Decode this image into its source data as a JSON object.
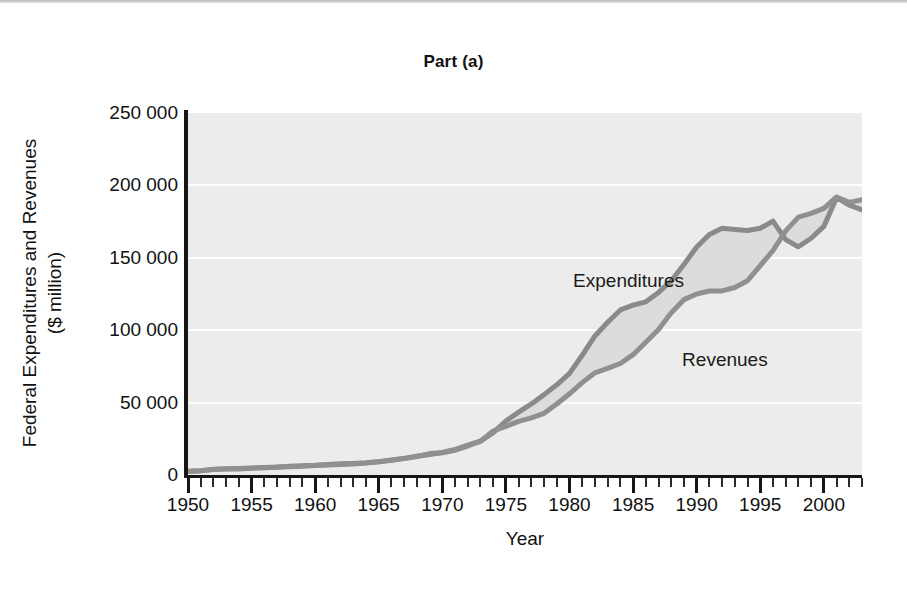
{
  "figure": {
    "title": "Part (a)",
    "background_color": "#ffffff",
    "plot_background_color": "#ececec",
    "axis_color": "#161616",
    "gridline_color": "#fdfdfd"
  },
  "axes": {
    "x_title": "Year",
    "y_title_line1": "Federal Expenditures and Revenues",
    "y_title_line2": "($ million)",
    "y_ticks": [
      "0",
      "50 000",
      "100 000",
      "150 000",
      "200 000",
      "250 000"
    ],
    "x_ticks": [
      "1950",
      "1955",
      "1960",
      "1965",
      "1970",
      "1975",
      "1980",
      "1985",
      "1990",
      "1995",
      "2000"
    ]
  },
  "annotations": {
    "expenditures_label": "Expenditures",
    "revenues_label": "Revenues"
  },
  "chart_data": {
    "type": "area",
    "title": "Part (a)",
    "subtitle": "",
    "xlabel": "Year",
    "ylabel": "Federal Expenditures and Revenues ($ million)",
    "xlim": [
      1950,
      2003
    ],
    "ylim": [
      0,
      250000
    ],
    "grid": true,
    "grid_axis": "y",
    "legend_position": "in-plot-annotation",
    "y_tick_values": [
      0,
      50000,
      100000,
      150000,
      200000,
      250000
    ],
    "x_tick_values": [
      1950,
      1955,
      1960,
      1965,
      1970,
      1975,
      1980,
      1985,
      1990,
      1995,
      2000
    ],
    "x_minor_tick_interval": 1,
    "x": [
      1950,
      1951,
      1952,
      1953,
      1954,
      1955,
      1956,
      1957,
      1958,
      1959,
      1960,
      1961,
      1962,
      1963,
      1964,
      1965,
      1966,
      1967,
      1968,
      1969,
      1970,
      1971,
      1972,
      1973,
      1974,
      1975,
      1976,
      1977,
      1978,
      1979,
      1980,
      1981,
      1982,
      1983,
      1984,
      1985,
      1986,
      1987,
      1988,
      1989,
      1990,
      1991,
      1992,
      1993,
      1994,
      1995,
      1996,
      1997,
      1998,
      1999,
      2000,
      2001,
      2002,
      2003
    ],
    "series": [
      {
        "name": "Expenditures",
        "color": "#8a8a8a",
        "values": [
          2600,
          3000,
          3900,
          4300,
          4500,
          4800,
          5100,
          5500,
          6100,
          6400,
          6700,
          7300,
          7700,
          8000,
          8400,
          9200,
          10300,
          11500,
          12900,
          14200,
          15600,
          17600,
          20600,
          23300,
          29300,
          37300,
          43400,
          49100,
          55500,
          62300,
          70200,
          82700,
          96000,
          105500,
          114000,
          117300,
          119600,
          126100,
          134100,
          145400,
          157500,
          166100,
          170400,
          169500,
          168800,
          170400,
          175300,
          162600,
          157600,
          163500,
          171700,
          191500,
          186400,
          183100
        ]
      },
      {
        "name": "Revenues",
        "color": "#909090",
        "values": [
          2400,
          2900,
          3800,
          4100,
          4200,
          4700,
          5000,
          5300,
          5700,
          6100,
          6500,
          6900,
          7200,
          7600,
          8200,
          9100,
          10100,
          11300,
          12800,
          14800,
          15300,
          17100,
          20000,
          23400,
          30400,
          33600,
          37000,
          39400,
          42600,
          49000,
          56100,
          63800,
          70600,
          73600,
          77000,
          83100,
          91700,
          100500,
          112000,
          121100,
          125000,
          127100,
          127100,
          129500,
          134200,
          144600,
          155000,
          168600,
          178100,
          180700,
          184100,
          192000,
          188300,
          190200
        ]
      }
    ],
    "fill_between": {
      "color": "#dcdcdc",
      "between": [
        "Expenditures",
        "Revenues"
      ]
    },
    "annotations": [
      {
        "text": "Expenditures",
        "x": 1985,
        "y": 133000
      },
      {
        "text": "Revenues",
        "x": 1992,
        "y": 79000
      }
    ]
  }
}
